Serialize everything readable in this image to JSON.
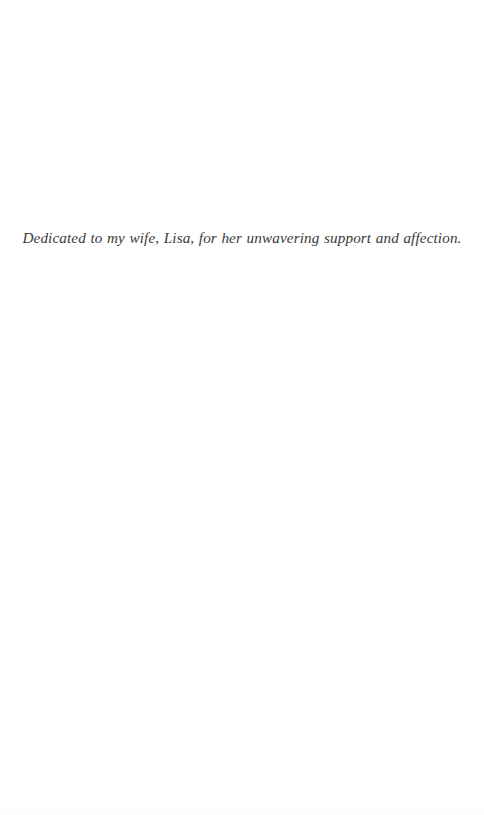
{
  "page": {
    "kind": "book-dedication-page",
    "width": 484,
    "height": 815,
    "background_color": "#ffffff",
    "text_color": "#3a3a3a"
  },
  "dedication": {
    "text": "Dedicated to my wife, Lisa, for her unwavering support and affection."
  }
}
